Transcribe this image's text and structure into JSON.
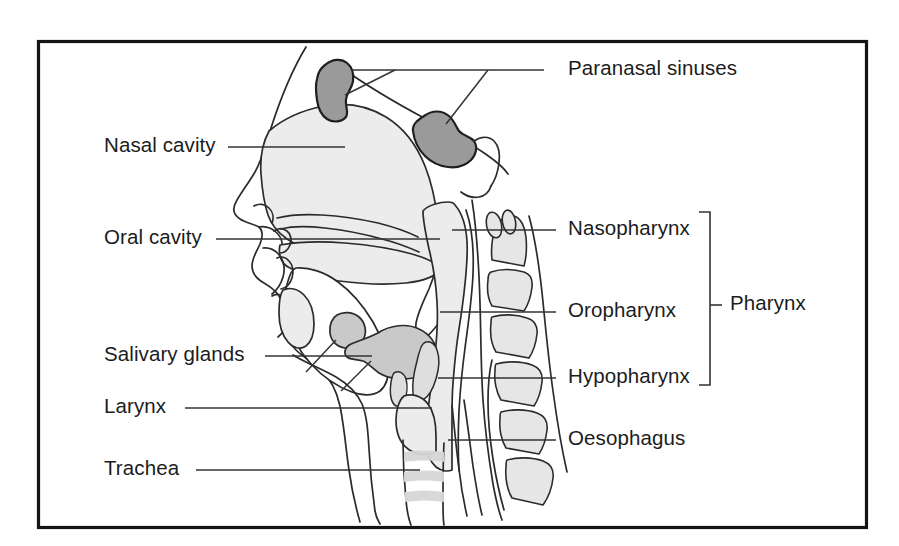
{
  "figure": {
    "frame_color": "#141414",
    "background_color": "#ffffff"
  },
  "colors": {
    "outline": "#2b2b2b",
    "sinus_fill": "#9a9a9a",
    "gland_fill": "#c9c9c9",
    "tissue_fill": "#ececec",
    "bone_fill": "#e6e6e6",
    "leader": "#333333"
  },
  "labels": {
    "left": [
      {
        "id": "nasal-cavity",
        "text": "Nasal cavity",
        "x": 104,
        "y": 135,
        "leader_from": [
          228,
          147
        ],
        "leader_to": [
          345,
          147
        ]
      },
      {
        "id": "oral-cavity",
        "text": "Oral cavity",
        "x": 104,
        "y": 227,
        "leader_from": [
          216,
          239
        ],
        "leader_to": [
          440,
          239
        ]
      },
      {
        "id": "salivary-glands",
        "text": "Salivary glands",
        "x": 104,
        "y": 344,
        "leader_from": [
          265,
          356
        ],
        "leader_to": [
          372,
          356
        ]
      },
      {
        "id": "larynx",
        "text": "Larynx",
        "x": 104,
        "y": 396,
        "leader_from": [
          185,
          408
        ],
        "leader_to": [
          432,
          408
        ]
      },
      {
        "id": "trachea",
        "text": "Trachea",
        "x": 104,
        "y": 458,
        "leader_from": [
          196,
          470
        ],
        "leader_to": [
          420,
          470
        ]
      }
    ],
    "right": [
      {
        "id": "paranasal-sinuses",
        "text": "Paranasal sinuses",
        "x": 568,
        "y": 58,
        "leader_from": [
          544,
          70
        ],
        "leader_to": [
          352,
          70
        ]
      },
      {
        "id": "nasopharynx",
        "text": "Nasopharynx",
        "x": 568,
        "y": 218,
        "leader_from": [
          556,
          230
        ],
        "leader_to": [
          452,
          230
        ]
      },
      {
        "id": "oropharynx",
        "text": "Oropharynx",
        "x": 568,
        "y": 300,
        "leader_from": [
          556,
          312
        ],
        "leader_to": [
          440,
          312
        ]
      },
      {
        "id": "hypopharynx",
        "text": "Hypopharynx",
        "x": 568,
        "y": 366,
        "leader_from": [
          556,
          378
        ],
        "leader_to": [
          438,
          378
        ]
      },
      {
        "id": "oesophagus",
        "text": "Oesophagus",
        "x": 568,
        "y": 428,
        "leader_from": [
          556,
          440
        ],
        "leader_to": [
          448,
          440
        ]
      }
    ],
    "group": {
      "id": "pharynx",
      "text": "Pharynx",
      "x": 730,
      "y": 302,
      "bracket": {
        "x": 710,
        "y_top": 212,
        "y_bottom": 385,
        "tick_x": 700,
        "arm": 11,
        "mid_y": 313,
        "mid_tick_to": 722
      }
    }
  },
  "structures": [
    {
      "id": "head-profile-outline",
      "name": "Facial profile and neck contour"
    },
    {
      "id": "nasal-cavity-region",
      "name": "Nasal cavity"
    },
    {
      "id": "frontal-sinus",
      "name": "Frontal paranasal sinus"
    },
    {
      "id": "sphenoid-sinus",
      "name": "Sphenoid paranasal sinus"
    },
    {
      "id": "hard-palate",
      "name": "Hard palate"
    },
    {
      "id": "soft-palate-uvula",
      "name": "Soft palate and uvula"
    },
    {
      "id": "tongue",
      "name": "Tongue"
    },
    {
      "id": "parotid-gland",
      "name": "Parotid salivary gland"
    },
    {
      "id": "submandibular-gland",
      "name": "Submandibular salivary gland"
    },
    {
      "id": "epiglottis",
      "name": "Epiglottis"
    },
    {
      "id": "larynx-region",
      "name": "Larynx"
    },
    {
      "id": "trachea-rings",
      "name": "Tracheal cartilage rings"
    },
    {
      "id": "oesophagus-tube",
      "name": "Oesophagus"
    },
    {
      "id": "cervical-vertebrae",
      "name": "Cervical vertebral column"
    }
  ]
}
